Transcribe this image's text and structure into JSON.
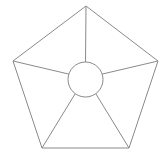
{
  "figure": {
    "title": "",
    "caption": "",
    "background_color": "#ffffff",
    "stroke_color": "#8a8a8a",
    "stroke_width": 1,
    "width": 167,
    "height": 161
  },
  "chart_data": {
    "type": "diagram",
    "shape": "regular-pentagon-with-central-hub",
    "title": "",
    "xlabel": "",
    "ylabel": "",
    "grid": false,
    "legend": null,
    "annotations": [],
    "sectors": 5,
    "outline": {
      "name": "pentagon",
      "sides": 5,
      "vertices": [
        {
          "label": "top",
          "x": 86,
          "y": 6
        },
        {
          "label": "right",
          "x": 158,
          "y": 61
        },
        {
          "label": "bottom-right",
          "x": 129,
          "y": 148
        },
        {
          "label": "bottom-left",
          "x": 42,
          "y": 148
        },
        {
          "label": "left",
          "x": 13,
          "y": 61
        }
      ]
    },
    "hub": {
      "name": "center-circle",
      "cx": 85.5,
      "cy": 79.5,
      "r": 17.5,
      "fill": "#ffffff"
    },
    "spokes": [
      {
        "label": "spoke-to-top",
        "from": {
          "x": 85.5,
          "y": 62.0
        },
        "to": {
          "x": 86,
          "y": 6
        }
      },
      {
        "label": "spoke-to-right",
        "from": {
          "x": 102.1,
          "y": 74.1
        },
        "to": {
          "x": 158,
          "y": 61
        }
      },
      {
        "label": "spoke-to-bottom-right",
        "from": {
          "x": 95.8,
          "y": 93.7
        },
        "to": {
          "x": 129,
          "y": 148
        }
      },
      {
        "label": "spoke-to-bottom-left",
        "from": {
          "x": 75.2,
          "y": 93.7
        },
        "to": {
          "x": 42,
          "y": 148
        }
      },
      {
        "label": "spoke-to-left",
        "from": {
          "x": 68.9,
          "y": 74.1
        },
        "to": {
          "x": 13,
          "y": 61
        }
      }
    ]
  },
  "accessibility": {
    "description": "Line drawing of a regular pentagon with a circle at its center and five straight spokes connecting the circle to each pentagon vertex."
  }
}
